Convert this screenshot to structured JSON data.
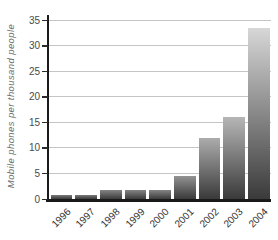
{
  "chart_data": {
    "type": "bar",
    "title": "",
    "xlabel": "",
    "ylabel": "Mobile phones per thousand people",
    "categories": [
      "1996",
      "1997",
      "1998",
      "1999",
      "2000",
      "2001",
      "2002",
      "2003",
      "2004"
    ],
    "values": [
      0.7,
      0.7,
      1.8,
      1.8,
      1.8,
      4.5,
      12,
      16,
      33.5
    ],
    "ylim": [
      0,
      35
    ],
    "yticks": [
      0,
      5,
      10,
      15,
      20,
      25,
      30,
      35
    ],
    "grid": "horizontal",
    "legend": "none",
    "bar_style": {
      "gradient_bottom": "#3a3a3a",
      "gradient_top_tallest": "#d7d7d7"
    }
  },
  "colors": {
    "background": "#ffffff",
    "axis": "#1a1a1a",
    "gridline": "#c5c5c5",
    "tick_label": "#4a4a4a",
    "axis_title": "#6b6b6b",
    "x_label": "#333333"
  }
}
